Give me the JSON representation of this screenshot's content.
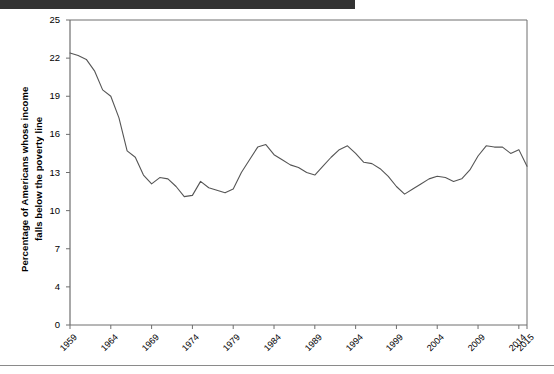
{
  "page": {
    "background_color": "#ffffff",
    "top_bar_color": "#333333",
    "rule_color": "#8a8a8a"
  },
  "chart_data": {
    "type": "line",
    "title": "",
    "subtitle": "",
    "xlabel": "",
    "ylabel_line1": "Percentage of Americans whose income",
    "ylabel_line2": "falls below the poverty line",
    "grid": false,
    "legend": false,
    "legend_position": "none",
    "line_color": "#555555",
    "axis_color": "#6e6e6e",
    "ylim": [
      0,
      25
    ],
    "ytick_labels": [
      "25",
      "22",
      "19",
      "16",
      "13",
      "10",
      "7",
      "4",
      "0"
    ],
    "ytick_values": [
      25,
      22,
      19,
      16,
      13,
      10,
      7,
      4,
      0
    ],
    "ytick_scale": "equal-spaced",
    "xtick_labels": [
      "1959",
      "1964",
      "1969",
      "1974",
      "1979",
      "1984",
      "1989",
      "1994",
      "1999",
      "2004",
      "2009",
      "2014",
      "2015"
    ],
    "xtick_values": [
      1959,
      1964,
      1969,
      1974,
      1979,
      1984,
      1989,
      1994,
      1999,
      2004,
      2009,
      2014,
      2015
    ],
    "xlim": [
      1959,
      2015
    ],
    "series": [
      {
        "name": "Poverty rate",
        "x": [
          1959,
          1960,
          1961,
          1962,
          1963,
          1964,
          1965,
          1966,
          1967,
          1968,
          1969,
          1970,
          1971,
          1972,
          1973,
          1974,
          1975,
          1976,
          1977,
          1978,
          1979,
          1980,
          1981,
          1982,
          1983,
          1984,
          1985,
          1986,
          1987,
          1988,
          1989,
          1990,
          1991,
          1992,
          1993,
          1994,
          1995,
          1996,
          1997,
          1998,
          1999,
          2000,
          2001,
          2002,
          2003,
          2004,
          2005,
          2006,
          2007,
          2008,
          2009,
          2010,
          2011,
          2012,
          2013,
          2014,
          2015
        ],
        "values": [
          22.4,
          22.2,
          21.9,
          21.0,
          19.5,
          19.0,
          17.3,
          14.7,
          14.2,
          12.8,
          12.1,
          12.6,
          12.5,
          11.9,
          11.1,
          11.2,
          12.3,
          11.8,
          11.6,
          11.4,
          11.7,
          13.0,
          14.0,
          15.0,
          15.2,
          14.4,
          14.0,
          13.6,
          13.4,
          13.0,
          12.8,
          13.5,
          14.2,
          14.8,
          15.1,
          14.5,
          13.8,
          13.7,
          13.3,
          12.7,
          11.9,
          11.3,
          11.7,
          12.1,
          12.5,
          12.7,
          12.6,
          12.3,
          12.5,
          13.2,
          14.3,
          15.1,
          15.0,
          15.0,
          14.5,
          14.8,
          13.5
        ]
      }
    ]
  }
}
